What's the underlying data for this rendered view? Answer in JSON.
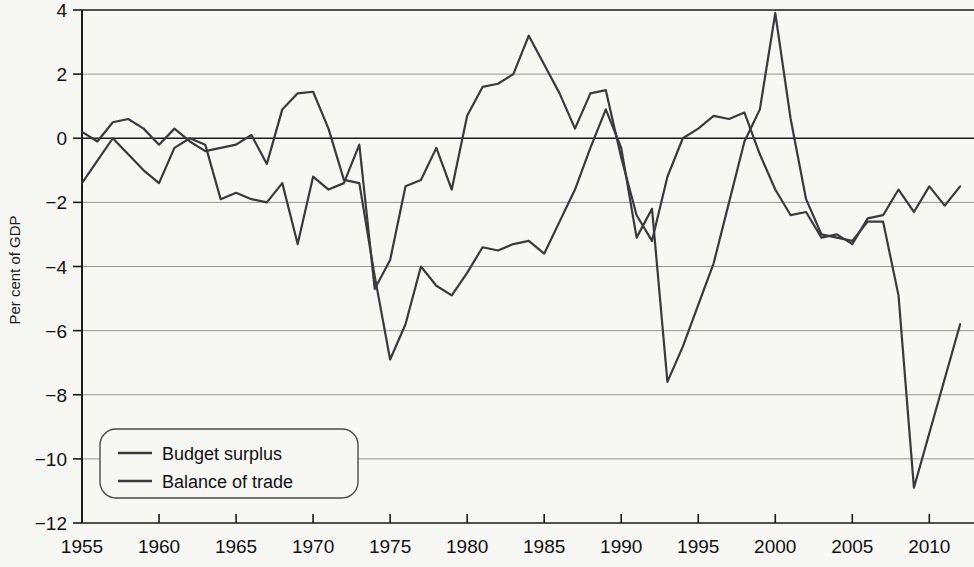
{
  "chart_data": {
    "type": "line",
    "title": "",
    "xlabel": "",
    "ylabel": "Per cent of GDP",
    "xlim": [
      1955,
      1913
    ],
    "x_range": [
      1955,
      2012
    ],
    "ylim": [
      -12,
      4
    ],
    "grid": true,
    "legend_position": "bottom-left",
    "x_ticks": [
      "1955",
      "1960",
      "1965",
      "1970",
      "1975",
      "1980",
      "1985",
      "1990",
      "1995",
      "2000",
      "2005",
      "2010"
    ],
    "x_tick_values": [
      1955,
      1960,
      1965,
      1970,
      1975,
      1980,
      1985,
      1990,
      1995,
      2000,
      2005,
      2010
    ],
    "y_ticks": [
      "4",
      "2",
      "0",
      "−2",
      "−4",
      "−6",
      "−8",
      "−10",
      "−12"
    ],
    "y_tick_values": [
      4,
      2,
      0,
      -2,
      -4,
      -6,
      -8,
      -10,
      -12
    ],
    "x": [
      1955,
      1956,
      1957,
      1958,
      1959,
      1960,
      1961,
      1962,
      1963,
      1964,
      1965,
      1966,
      1967,
      1968,
      1969,
      1970,
      1971,
      1972,
      1973,
      1974,
      1975,
      1976,
      1977,
      1978,
      1979,
      1980,
      1981,
      1982,
      1983,
      1984,
      1985,
      1986,
      1987,
      1988,
      1989,
      1990,
      1991,
      1992,
      1993,
      1994,
      1995,
      1996,
      1997,
      1998,
      1999,
      2000,
      2001,
      2002,
      2003,
      2004,
      2005,
      2006,
      2007,
      2008,
      2009,
      2010,
      2011,
      2012
    ],
    "series": [
      {
        "name": "Budget surplus",
        "color": "#3a3a3a",
        "values": [
          0.2,
          -0.1,
          0.4,
          0.5,
          0.2,
          -0.3,
          0.3,
          -0.2,
          -0.4,
          -0.3,
          -0.2,
          0.0,
          -0.8,
          0.8,
          1.4,
          1.4,
          0.2,
          -1.3,
          -1.4,
          -4.3,
          -6.9,
          -5.8,
          -4.0,
          -4.6,
          -4.9,
          -4.2,
          -3.3,
          -3.5,
          -3.3,
          -3.2,
          -3.6,
          -2.6,
          -1.6,
          -0.3,
          0.9,
          -0.3,
          -3.1,
          -2.2,
          -7.6,
          -6.5,
          -5.2,
          -3.9,
          -2.0,
          -0.1,
          0.9,
          3.9,
          0.6,
          -1.9,
          -3.0,
          -3.1,
          -3.2,
          -2.6,
          -2.6,
          -4.9,
          -10.9,
          -9.2,
          -7.5,
          -5.8
        ]
      },
      {
        "name": "Balance of trade",
        "color": "#3a3a3a",
        "values": [
          -1.4,
          -0.7,
          0.0,
          -0.5,
          -1.0,
          -1.4,
          -0.3,
          0.0,
          -0.2,
          -1.9,
          -1.7,
          -1.9,
          -2.0,
          -1.4,
          -3.3,
          -1.2,
          -1.6,
          -1.4,
          -0.2,
          0.1,
          1.5,
          1.4,
          -2.2,
          -2.6,
          -2.6,
          -1.7,
          -2.1,
          -2.2,
          -1.9,
          -2.0,
          -3.2,
          -2.1,
          -1.6,
          -2.6,
          1.6,
          0.6,
          1.5,
          2.2,
          2.7,
          3.2,
          2.4,
          2.0,
          0.3,
          1.5,
          1.3,
          0.8,
          -0.6,
          -0.5,
          -3.1,
          -0.6,
          -0.1,
          -0.4,
          -0.5,
          -0.4,
          -0.2,
          -1.2,
          -1.4,
          -1.5
        ]
      }
    ],
    "series_reconstructed": {
      "note": "Series pixel-traced; see points arrays below for drawn polylines.",
      "budget_points": [
        [
          1955,
          0.2
        ],
        [
          1956,
          -0.1
        ],
        [
          1957,
          0.5
        ],
        [
          1958,
          0.6
        ],
        [
          1959,
          0.3
        ],
        [
          1960,
          -0.2
        ],
        [
          1961,
          0.3
        ],
        [
          1962,
          -0.1
        ],
        [
          1963,
          -0.4
        ],
        [
          1964,
          -0.3
        ],
        [
          1965,
          -0.2
        ],
        [
          1966,
          0.1
        ],
        [
          1967,
          -0.8
        ],
        [
          1968,
          0.9
        ],
        [
          1969,
          1.4
        ],
        [
          1970,
          1.45
        ],
        [
          1971,
          0.3
        ],
        [
          1972,
          -1.3
        ],
        [
          1973,
          -1.4
        ],
        [
          1974,
          -4.3
        ],
        [
          1975,
          -6.9
        ],
        [
          1976,
          -5.8
        ],
        [
          1977,
          -4.0
        ],
        [
          1978,
          -4.6
        ],
        [
          1979,
          -4.9
        ],
        [
          1980,
          -4.2
        ],
        [
          1981,
          -3.4
        ],
        [
          1982,
          -3.5
        ],
        [
          1983,
          -3.3
        ],
        [
          1984,
          -3.2
        ],
        [
          1985,
          -3.6
        ],
        [
          1986,
          -2.6
        ],
        [
          1987,
          -1.6
        ],
        [
          1988,
          -0.3
        ],
        [
          1989,
          0.9
        ],
        [
          1990,
          -0.3
        ],
        [
          1991,
          -3.1
        ],
        [
          1992,
          -2.2
        ],
        [
          1993,
          -7.6
        ],
        [
          1994,
          -6.5
        ],
        [
          1995,
          -5.2
        ],
        [
          1996,
          -3.9
        ],
        [
          1997,
          -2.0
        ],
        [
          1998,
          -0.1
        ],
        [
          1999,
          0.9
        ],
        [
          2000,
          3.9
        ],
        [
          2001,
          0.6
        ],
        [
          2002,
          -1.9
        ],
        [
          2003,
          -3.0
        ],
        [
          2004,
          -3.1
        ],
        [
          2005,
          -3.2
        ],
        [
          2006,
          -2.6
        ],
        [
          2007,
          -2.6
        ],
        [
          2008,
          -4.9
        ],
        [
          2009,
          -10.9
        ],
        [
          2010,
          -9.2
        ],
        [
          2011,
          -7.5
        ],
        [
          2012,
          -5.8
        ]
      ],
      "trade_points": [
        [
          1955,
          -1.4
        ],
        [
          1956,
          -0.7
        ],
        [
          1957,
          0.0
        ],
        [
          1958,
          -0.5
        ],
        [
          1959,
          -1.0
        ],
        [
          1960,
          -1.4
        ],
        [
          1961,
          -0.3
        ],
        [
          1962,
          0.0
        ],
        [
          1963,
          -0.2
        ],
        [
          1964,
          -1.9
        ],
        [
          1965,
          -1.7
        ],
        [
          1966,
          -1.9
        ],
        [
          1967,
          -2.0
        ],
        [
          1968,
          -1.4
        ],
        [
          1969,
          -3.3
        ],
        [
          1970,
          -1.2
        ],
        [
          1971,
          -1.6
        ],
        [
          1972,
          -1.4
        ],
        [
          1973,
          -0.2
        ],
        [
          1974,
          -4.7
        ],
        [
          1975,
          -3.8
        ],
        [
          1976,
          -1.5
        ],
        [
          1977,
          -1.3
        ],
        [
          1978,
          -0.3
        ],
        [
          1979,
          -1.6
        ],
        [
          1980,
          0.7
        ],
        [
          1981,
          1.6
        ],
        [
          1982,
          1.7
        ],
        [
          1983,
          2.0
        ],
        [
          1984,
          3.2
        ],
        [
          1985,
          2.3
        ],
        [
          1986,
          1.4
        ],
        [
          1987,
          0.3
        ],
        [
          1988,
          1.4
        ],
        [
          1989,
          1.5
        ],
        [
          1990,
          -0.6
        ],
        [
          1991,
          -2.4
        ],
        [
          1992,
          -3.2
        ],
        [
          1993,
          -1.2
        ],
        [
          1994,
          0.0
        ],
        [
          1995,
          0.3
        ],
        [
          1996,
          0.7
        ],
        [
          1997,
          0.6
        ],
        [
          1998,
          0.8
        ],
        [
          1999,
          -0.5
        ],
        [
          2000,
          -1.6
        ],
        [
          2001,
          -2.4
        ],
        [
          2002,
          -2.3
        ],
        [
          2003,
          -3.1
        ],
        [
          2004,
          -3.0
        ],
        [
          2005,
          -3.3
        ],
        [
          2006,
          -2.5
        ],
        [
          2007,
          -2.4
        ],
        [
          2008,
          -1.6
        ],
        [
          2009,
          -2.3
        ],
        [
          2010,
          -1.5
        ],
        [
          2011,
          -2.1
        ],
        [
          2012,
          -1.5
        ]
      ]
    },
    "legend": [
      {
        "label": "Budget surplus",
        "color": "#3a3a3a"
      },
      {
        "label": "Balance of trade",
        "color": "#3a3a3a"
      }
    ],
    "colors": {
      "background": "#f7f7f4",
      "grid": "#8a8a8a",
      "axis": "#1a1a1a",
      "zero_line": "#1a1a1a",
      "line": "#3a3a3a"
    }
  }
}
